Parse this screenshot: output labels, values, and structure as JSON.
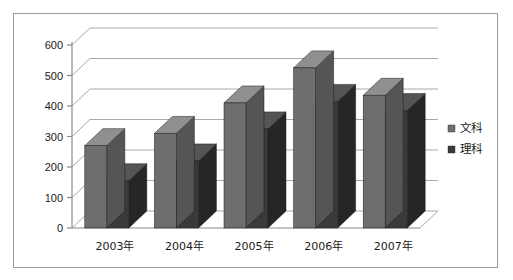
{
  "chart_data": {
    "type": "bar",
    "title": "",
    "subtitle": "",
    "xlabel": "",
    "ylabel": "",
    "categories": [
      "2003年",
      "2004年",
      "2005年",
      "2006年",
      "2007年"
    ],
    "series": [
      {
        "name": "文科",
        "values": [
          270,
          310,
          410,
          525,
          435
        ],
        "color": "#6e6e6e"
      },
      {
        "name": "理科",
        "values": [
          155,
          220,
          325,
          415,
          385
        ],
        "color": "#3a3a3a"
      }
    ],
    "ylim": [
      0,
      600
    ],
    "ytick_values": [
      0,
      100,
      200,
      300,
      400,
      500,
      600
    ],
    "ytick_labels": [
      "0",
      "100",
      "200",
      "300",
      "400",
      "500",
      "600"
    ],
    "grid": true,
    "grid_axis": "y",
    "legend_position": "right",
    "style": "3d-clustered-column"
  },
  "axis": {
    "y_labels": [
      "600",
      "500",
      "400",
      "300",
      "200",
      "100",
      "0"
    ],
    "x_labels": [
      "2003年",
      "2004年",
      "2005年",
      "2006年",
      "2007年"
    ]
  },
  "legend": {
    "items": [
      {
        "label": "文科",
        "swatch": "#6e6e6e"
      },
      {
        "label": "理科",
        "swatch": "#3a3a3a"
      }
    ]
  },
  "colors": {
    "frame_border": "#9a9a9a",
    "gridline": "#a8a8a8",
    "axis_line": "#8a8a8a",
    "series_light_front": "#6e6e6e",
    "series_light_top": "#8f8f8f",
    "series_light_side": "#555555",
    "series_dark_front": "#3a3a3a",
    "series_dark_top": "#555555",
    "series_dark_side": "#262626",
    "background": "#ffffff"
  }
}
